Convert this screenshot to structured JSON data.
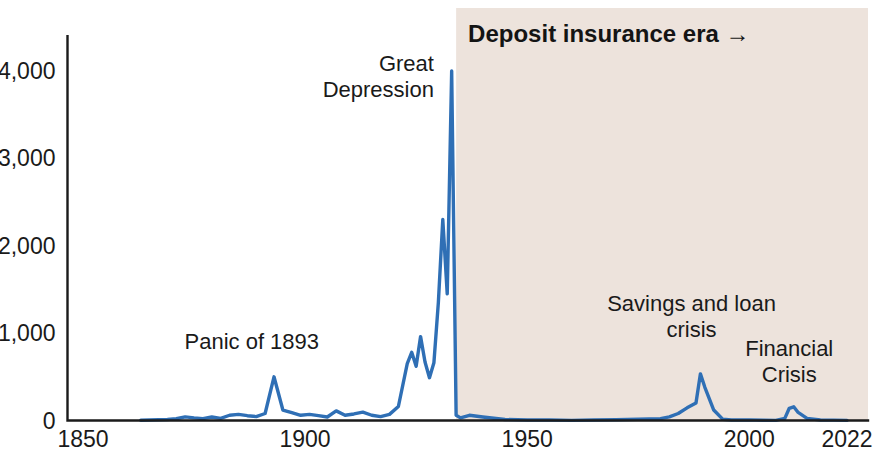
{
  "chart_data": {
    "type": "line",
    "title": "",
    "subtitle": "",
    "xlabel": "",
    "ylabel": "",
    "xlim": [
      1850,
      2022
    ],
    "ylim": [
      0,
      4400
    ],
    "grid": false,
    "legend_position": "none",
    "series_name": "Bank failures",
    "line_color": "#2f6fb5",
    "axis_color": "#1a1a1a",
    "background_color": "#ffffff",
    "y_ticks": [
      {
        "value": 0,
        "label": "0"
      },
      {
        "value": 1000,
        "label": "1,000"
      },
      {
        "value": 2000,
        "label": "2,000"
      },
      {
        "value": 3000,
        "label": "3,000"
      },
      {
        "value": 4000,
        "label": "4,000"
      }
    ],
    "x_ticks": [
      {
        "value": 1850,
        "label": "1850"
      },
      {
        "value": 1900,
        "label": "1900"
      },
      {
        "value": 1950,
        "label": "1950"
      },
      {
        "value": 2000,
        "label": "2000"
      },
      {
        "value": 2022,
        "label": "2022"
      }
    ],
    "shaded_regions": [
      {
        "name": "deposit-insurance-era",
        "label": "Deposit insurance era →",
        "x_start": 1934,
        "x_end": 2022,
        "color": "#ede3dc"
      }
    ],
    "annotations": [
      {
        "name": "panic-of-1893",
        "text": "Panic of 1893",
        "lines": [
          "Panic of 1893"
        ],
        "x": 1888,
        "y": 820,
        "align": "center"
      },
      {
        "name": "great-depression",
        "text": "Great Depression",
        "lines": [
          "Great",
          "Depression"
        ],
        "x": 1929,
        "y": 4000,
        "align": "right"
      },
      {
        "name": "savings-and-loan-crisis",
        "text": "Savings and loan crisis",
        "lines": [
          "Savings and loan",
          "crisis"
        ],
        "x": 1987,
        "y": 1250,
        "align": "center"
      },
      {
        "name": "financial-crisis",
        "text": "Financial Crisis",
        "lines": [
          "Financial",
          "Crisis"
        ],
        "x": 2009,
        "y": 740,
        "align": "center"
      }
    ],
    "x": [
      1863,
      1865,
      1867,
      1869,
      1871,
      1873,
      1875,
      1877,
      1879,
      1881,
      1883,
      1885,
      1887,
      1889,
      1891,
      1893,
      1895,
      1897,
      1899,
      1901,
      1903,
      1905,
      1907,
      1909,
      1911,
      1913,
      1915,
      1917,
      1919,
      1921,
      1923,
      1924,
      1925,
      1926,
      1927,
      1928,
      1929,
      1930,
      1931,
      1932,
      1933,
      1934,
      1935,
      1937,
      1940,
      1945,
      1950,
      1955,
      1960,
      1965,
      1970,
      1975,
      1980,
      1982,
      1984,
      1986,
      1988,
      1989,
      1990,
      1992,
      1994,
      1996,
      2000,
      2003,
      2006,
      2008,
      2009,
      2010,
      2011,
      2013,
      2016,
      2019,
      2022
    ],
    "y": [
      3,
      5,
      8,
      12,
      20,
      42,
      30,
      22,
      40,
      25,
      60,
      70,
      55,
      45,
      80,
      500,
      120,
      90,
      60,
      70,
      55,
      40,
      110,
      60,
      75,
      95,
      60,
      45,
      70,
      160,
      650,
      780,
      620,
      960,
      670,
      490,
      660,
      1350,
      2300,
      1450,
      4000,
      60,
      30,
      60,
      40,
      12,
      5,
      6,
      2,
      5,
      8,
      14,
      22,
      42,
      80,
      145,
      200,
      534,
      380,
      120,
      15,
      6,
      7,
      3,
      1,
      25,
      140,
      157,
      92,
      24,
      5,
      4,
      1
    ]
  }
}
